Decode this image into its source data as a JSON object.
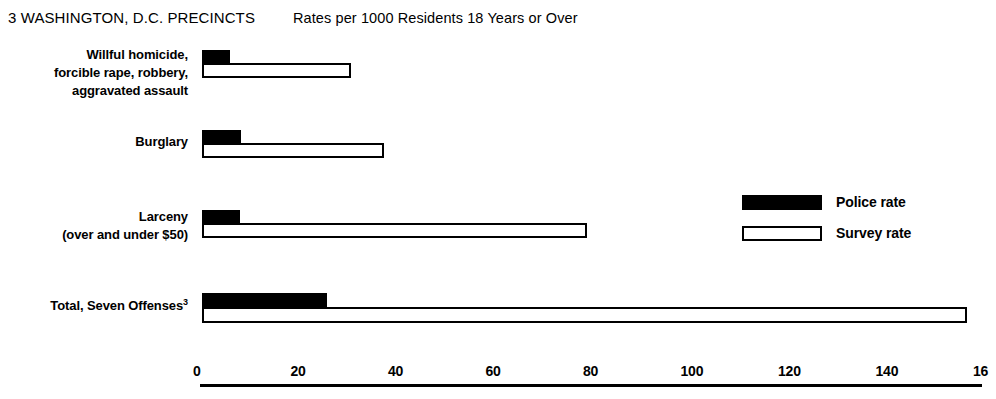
{
  "header": {
    "title": "3 WASHINGTON, D.C. PRECINCTS",
    "subtitle": "Rates per 1000 Residents 18 Years or Over"
  },
  "legend": {
    "police_label": "Police rate",
    "survey_label": "Survey rate",
    "police_color": "#000000",
    "survey_color": "#ffffff",
    "position": "middle-right"
  },
  "axis": {
    "tick_labels": [
      "0",
      "20",
      "40",
      "60",
      "80",
      "100",
      "120",
      "140",
      "16"
    ],
    "tick_values": [
      0,
      20,
      40,
      60,
      80,
      100,
      120,
      140,
      160
    ]
  },
  "categories": [
    {
      "lines": [
        "Willful homicide,",
        "forcible rape, robbery,",
        "aggravated assault"
      ],
      "footnote": ""
    },
    {
      "lines": [
        "Burglary"
      ],
      "footnote": ""
    },
    {
      "lines": [
        "Larceny",
        "(over and under $50)"
      ],
      "footnote": ""
    },
    {
      "lines": [
        "Total, Seven Offenses"
      ],
      "footnote": "3"
    }
  ],
  "chart_data": {
    "type": "bar",
    "orientation": "horizontal",
    "title": "3 WASHINGTON, D.C. PRECINCTS",
    "subtitle": "Rates per 1000 Residents 18 Years or Over",
    "xlabel": "Rates per 1000 Residents 18 Years or Over",
    "ylabel": "",
    "xlim": [
      0,
      160
    ],
    "xticks": [
      0,
      20,
      40,
      60,
      80,
      100,
      120,
      140,
      160
    ],
    "grid": false,
    "legend_position": "middle-right",
    "categories": [
      "Willful homicide, forcible rape, robbery, aggravated assault",
      "Burglary",
      "Larceny (over and under $50)",
      "Total, Seven Offenses3"
    ],
    "series": [
      {
        "name": "Police rate",
        "color": "#000000",
        "values": [
          5.7,
          8.1,
          7.8,
          25.7
        ]
      },
      {
        "name": "Survey rate",
        "color": "#ffffff",
        "values": [
          30.5,
          37.3,
          79.0,
          157.0
        ]
      }
    ]
  },
  "layout": {
    "x_origin_px": 202,
    "px_per_unit": 4.875,
    "groups": [
      {
        "police_top": 50,
        "survey_top": 63,
        "bar_height": 13
      },
      {
        "police_top": 130,
        "survey_top": 143,
        "bar_height": 13
      },
      {
        "police_top": 210,
        "survey_top": 223,
        "bar_height": 13
      },
      {
        "police_top": 293,
        "survey_top": 307,
        "bar_height": 14
      }
    ],
    "label_tops": [
      46,
      133,
      208,
      297
    ]
  }
}
